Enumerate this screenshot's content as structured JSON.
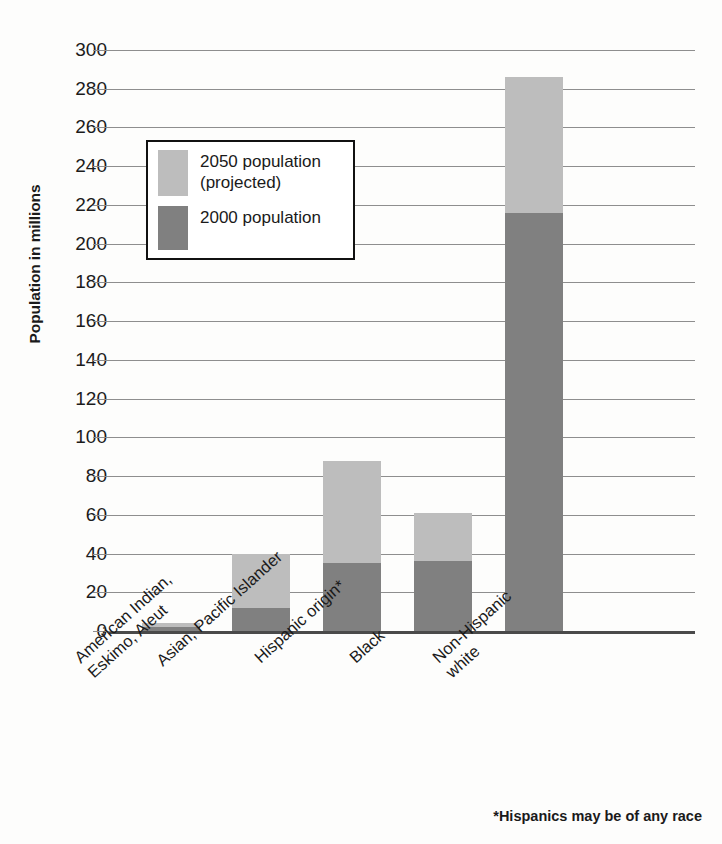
{
  "chart_data": {
    "type": "bar",
    "subtype": "stacked-vertical",
    "title": "",
    "xlabel": "",
    "ylabel": "Population in millions",
    "ylim": [
      0,
      300
    ],
    "ytick_step": 20,
    "yticks": [
      300,
      280,
      260,
      240,
      220,
      200,
      180,
      160,
      140,
      120,
      100,
      80,
      60,
      40,
      20,
      0
    ],
    "grid": true,
    "legend_position": "upper-left-inside",
    "categories": [
      "American Indian,\nEskimo, Aleut",
      "Asian, Pacific Islander",
      "Hispanic origin*",
      "Black",
      "Non-Hispanic\nwhite"
    ],
    "series": [
      {
        "name": "2000 population",
        "color": "#808080",
        "values": [
          2,
          12,
          35,
          36,
          216
        ]
      },
      {
        "name": "2050 population\n(projected)",
        "color": "#bdbdbd",
        "values": [
          4,
          40,
          88,
          61,
          286
        ],
        "note": "values are cumulative stack tops (total 2050 projection)"
      }
    ],
    "annotations": [
      "*Hispanics may be of any race"
    ]
  },
  "legend": {
    "entries": [
      {
        "label": "2050 population\n(projected)",
        "color": "#bdbdbd",
        "swatch": "light"
      },
      {
        "label": "2000 population",
        "color": "#808080",
        "swatch": "dark"
      }
    ]
  },
  "footnote": "*Hispanics may be of any race",
  "colors": {
    "series_2000": "#808080",
    "series_2050": "#bdbdbd",
    "gridline": "#8e8e8e",
    "axis": "#4a4a4a",
    "text": "#1a1a1a",
    "background": "#fdfdfc"
  }
}
